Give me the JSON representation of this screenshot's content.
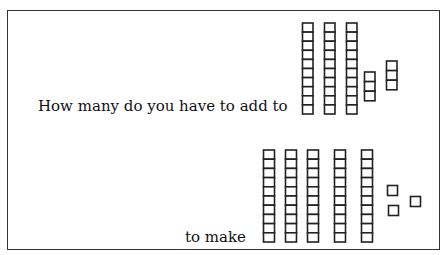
{
  "worksheet": {
    "question_line_1": "How many do you have to add to",
    "question_line_2": "to make",
    "ink_color": "#222222"
  },
  "first_quantity": {
    "label": "base-ten blocks shown after 'add to'",
    "tens_rods": 3,
    "ones_groups": [
      3,
      3
    ],
    "value": 36
  },
  "target_quantity": {
    "label": "base-ten blocks shown after 'to make'",
    "tens_rods": 5,
    "ones": 3,
    "value": 53
  }
}
